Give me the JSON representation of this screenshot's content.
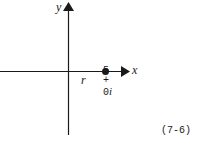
{
  "diagram": {
    "axes": {
      "x_label": "x",
      "y_label": "y"
    },
    "point": {
      "label_real": "5",
      "label_plus": "+",
      "label_imag": "0",
      "label_i": "i",
      "radius_label": "r"
    },
    "equation_number": "(7-6)",
    "colors": {
      "ink": "#1a1a1a",
      "background": "#ffffff"
    }
  }
}
